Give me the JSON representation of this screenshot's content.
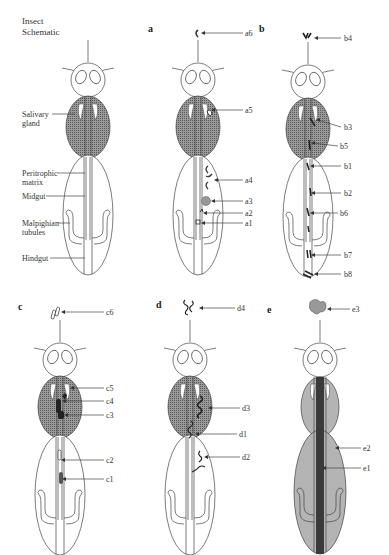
{
  "title": [
    "Insect",
    "Schematic"
  ],
  "schematic_labels": [
    {
      "id": "salivary",
      "text": [
        "Salivary",
        "gland"
      ],
      "x": 22,
      "y": 112
    },
    {
      "id": "peritrophic",
      "text": [
        "Peritrophic",
        "matrix"
      ],
      "x": 22,
      "y": 172
    },
    {
      "id": "midgut",
      "text": [
        "Midgut"
      ],
      "x": 22,
      "y": 196
    },
    {
      "id": "malpighian",
      "text": [
        "Malpighian",
        "tubules"
      ],
      "x": 22,
      "y": 222
    },
    {
      "id": "hindgut",
      "text": [
        "Hindgut"
      ],
      "x": 22,
      "y": 258
    }
  ],
  "panels": [
    {
      "id": "a",
      "label": "a",
      "annotations": [
        {
          "text": "a6",
          "y": 12
        },
        {
          "text": "a5",
          "y": 110
        },
        {
          "text": "a4",
          "y": 180
        },
        {
          "text": "a3",
          "y": 201
        },
        {
          "text": "a2",
          "y": 213
        },
        {
          "text": "a1",
          "y": 223
        }
      ]
    },
    {
      "id": "b",
      "label": "b",
      "annotations": [
        {
          "text": "b4",
          "y": 38
        },
        {
          "text": "b3",
          "y": 127
        },
        {
          "text": "b5",
          "y": 146
        },
        {
          "text": "b1",
          "y": 166
        },
        {
          "text": "b2",
          "y": 193
        },
        {
          "text": "b6",
          "y": 213
        },
        {
          "text": "b7",
          "y": 255
        },
        {
          "text": "b8",
          "y": 274
        }
      ]
    },
    {
      "id": "c",
      "label": "c",
      "annotations": [
        {
          "text": "c6",
          "y": 312
        },
        {
          "text": "c5",
          "y": 388
        },
        {
          "text": "c4",
          "y": 401
        },
        {
          "text": "c3",
          "y": 415
        },
        {
          "text": "c2",
          "y": 460
        },
        {
          "text": "c1",
          "y": 479
        }
      ]
    },
    {
      "id": "d",
      "label": "d",
      "annotations": [
        {
          "text": "d4",
          "y": 308
        },
        {
          "text": "d3",
          "y": 408
        },
        {
          "text": "d1",
          "y": 434
        },
        {
          "text": "d2",
          "y": 457
        }
      ]
    },
    {
      "id": "e",
      "label": "e",
      "annotations": [
        {
          "text": "e3",
          "y": 309
        },
        {
          "text": "e2",
          "y": 448
        },
        {
          "text": "e1",
          "y": 468
        }
      ]
    }
  ],
  "colors": {
    "outline": "#444444",
    "hatch_fill": "#8a8a8a",
    "panel_e_fill": "#b4b4b4",
    "panel_e_gut": "#3a3a3a"
  }
}
